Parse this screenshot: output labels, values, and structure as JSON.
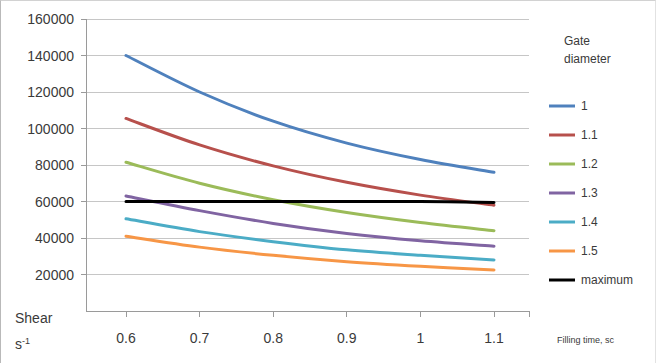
{
  "chart_data": {
    "type": "line",
    "title": "",
    "xlabel": "Filling time, sc",
    "ylabel_line1": "Shear",
    "ylabel_line2_base": "s",
    "ylabel_line2_sup": "-1",
    "legend_title_line1": "Gate",
    "legend_title_line2": "diameter",
    "legend_position": "right",
    "grid": true,
    "x": [
      0.6,
      0.7,
      0.8,
      0.9,
      1.0,
      1.1
    ],
    "xlim": [
      0.6,
      1.1
    ],
    "ylim": [
      0,
      160000
    ],
    "xticks": [
      "0.6",
      "0.7",
      "0.8",
      "0.9",
      "1",
      "1.1"
    ],
    "yticks": [
      "20000",
      "40000",
      "60000",
      "80000",
      "100000",
      "120000",
      "140000",
      "160000"
    ],
    "ytick_values": [
      20000,
      40000,
      60000,
      80000,
      100000,
      120000,
      140000,
      160000
    ],
    "series": [
      {
        "name": "1",
        "color": "#4F81BD",
        "values": [
          140000,
          120000,
          104000,
          92000,
          83000,
          76000
        ]
      },
      {
        "name": "1.1",
        "color": "#B7504C",
        "values": [
          105500,
          91000,
          79500,
          70500,
          63500,
          58000
        ]
      },
      {
        "name": "1.2",
        "color": "#9BBB59",
        "values": [
          81500,
          70000,
          61000,
          54000,
          48500,
          44000
        ]
      },
      {
        "name": "1.3",
        "color": "#8064A2",
        "values": [
          63000,
          55000,
          48000,
          42500,
          38500,
          35500
        ]
      },
      {
        "name": "1.4",
        "color": "#4BACC6",
        "values": [
          50500,
          43500,
          38000,
          33500,
          30500,
          28000
        ]
      },
      {
        "name": "1.5",
        "color": "#F79646",
        "values": [
          41000,
          35000,
          30500,
          27000,
          24500,
          22500
        ]
      },
      {
        "name": "maximum",
        "color": "#000000",
        "values": [
          60000,
          60000,
          60000,
          60000,
          60000,
          59500
        ]
      }
    ]
  }
}
